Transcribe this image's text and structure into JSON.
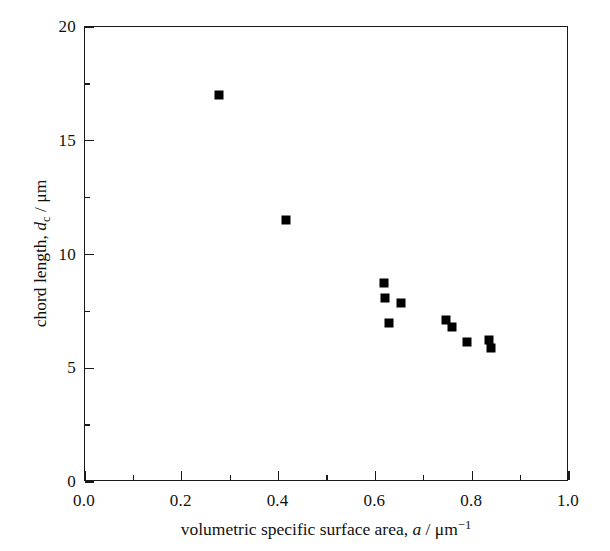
{
  "chart_data": {
    "type": "scatter",
    "title": "",
    "xlabel": "volumetric specific surface area, a / μm⁻¹",
    "ylabel": "chord length, d_c / μm",
    "xlim": [
      0.0,
      1.0
    ],
    "ylim": [
      0,
      20
    ],
    "grid": false,
    "legend": null,
    "marker": {
      "shape": "square",
      "color": "#000000",
      "size_px": 9
    },
    "x_ticks": [
      "0.0",
      "0.2",
      "0.4",
      "0.6",
      "0.8",
      "1.0"
    ],
    "x_tick_values": [
      0.0,
      0.2,
      0.4,
      0.6,
      0.8,
      1.0
    ],
    "x_minor_step": 0.1,
    "y_ticks": [
      "0",
      "5",
      "10",
      "15",
      "20"
    ],
    "y_tick_values": [
      0,
      5,
      10,
      15,
      20
    ],
    "y_minor_step": 2.5,
    "points": [
      {
        "x": 0.277,
        "y": 17.0
      },
      {
        "x": 0.415,
        "y": 11.5
      },
      {
        "x": 0.617,
        "y": 8.75
      },
      {
        "x": 0.62,
        "y": 8.1
      },
      {
        "x": 0.652,
        "y": 7.85
      },
      {
        "x": 0.628,
        "y": 7.0
      },
      {
        "x": 0.745,
        "y": 7.1
      },
      {
        "x": 0.758,
        "y": 6.8
      },
      {
        "x": 0.79,
        "y": 6.15
      },
      {
        "x": 0.835,
        "y": 6.25
      },
      {
        "x": 0.838,
        "y": 5.9
      }
    ]
  },
  "axis_titles": {
    "x_prefix": "volumetric specific surface area, ",
    "x_symbol": "a",
    "x_unit_sep": " / ",
    "x_unit": "μm",
    "x_unit_exp": "−1",
    "y_prefix": "chord length, ",
    "y_symbol": "d",
    "y_symbol_sub": "c",
    "y_unit_sep": " / ",
    "y_unit": "μm"
  },
  "style": {
    "frame_color": "#1a1a1a",
    "background": "#ffffff",
    "marker_color": "#000000"
  }
}
